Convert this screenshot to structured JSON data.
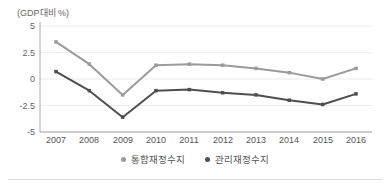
{
  "page": {
    "axis_unit_label": "(GDP대비 %)"
  },
  "chart_data": {
    "type": "line",
    "title": "",
    "ylabel": "(GDP대비 %)",
    "xlabel": "",
    "ylim": [
      -5,
      5
    ],
    "grid": true,
    "legend_position": "bottom",
    "categories": [
      "2007",
      "2008",
      "2009",
      "2010",
      "2011",
      "2012",
      "2013",
      "2014",
      "2015",
      "2016"
    ],
    "y_tick_labels": [
      "5",
      "2.5",
      "0",
      "-2.5",
      "-5"
    ],
    "y_tick_values": [
      5,
      2.5,
      0,
      -2.5,
      -5
    ],
    "series": [
      {
        "name": "통합재정수지",
        "color": "#9b9b9b",
        "values": [
          3.5,
          1.4,
          -1.5,
          1.3,
          1.4,
          1.3,
          1.0,
          0.6,
          0.0,
          1.0
        ]
      },
      {
        "name": "관리재정수지",
        "color": "#4f4f4f",
        "values": [
          0.7,
          -1.1,
          -3.6,
          -1.1,
          -1.0,
          -1.3,
          -1.5,
          -2.0,
          -2.4,
          -1.4
        ]
      }
    ]
  }
}
